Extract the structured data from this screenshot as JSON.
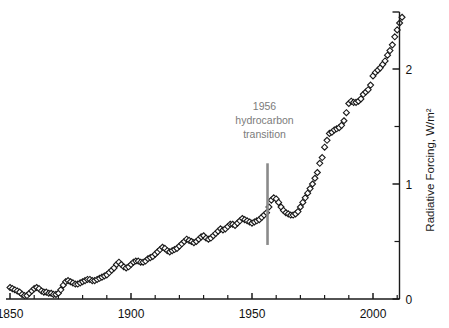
{
  "chart_data": {
    "type": "scatter",
    "title": "",
    "subtitle": "",
    "xlabel": "",
    "ylabel": "Radiative Forcing, W/m²",
    "xlim": [
      1848,
      2014
    ],
    "ylim": [
      0,
      2.6
    ],
    "x_ticks_major": [
      1850,
      1900,
      1950,
      2000
    ],
    "x_tick_labels": [
      "1850",
      "1900",
      "1950",
      "2000"
    ],
    "x_tick_interval_minor": 10,
    "y_ticks_major": [
      0,
      1,
      2
    ],
    "y_tick_labels": [
      "0",
      "1",
      "2"
    ],
    "y_ticks_minor": [
      0.5,
      1.5,
      2.5
    ],
    "grid": false,
    "legend": null,
    "axis_position": {
      "y_axis": "right",
      "x_axis": "bottom"
    },
    "marker": {
      "shape": "diamond-open",
      "size": 4,
      "edge_color": "#1a1a1a",
      "face_color": "#ffffff"
    },
    "annotations": [
      {
        "name": "hydrocarbon-transition",
        "lines": [
          "1956",
          "hydrocarbon",
          "transition"
        ],
        "x": 1956,
        "text_color": "#8a8a8a",
        "line_color": "#8a8a8a",
        "line_y_top": 1.18,
        "line_y_bottom": 0.47
      }
    ],
    "series": [
      {
        "name": "Radiative forcing",
        "x": [
          1850,
          1851,
          1852,
          1853,
          1854,
          1855,
          1856,
          1857,
          1858,
          1859,
          1860,
          1861,
          1862,
          1863,
          1864,
          1865,
          1866,
          1867,
          1868,
          1869,
          1870,
          1871,
          1872,
          1873,
          1874,
          1875,
          1876,
          1877,
          1878,
          1879,
          1880,
          1881,
          1882,
          1883,
          1884,
          1885,
          1886,
          1887,
          1888,
          1889,
          1890,
          1891,
          1892,
          1893,
          1894,
          1895,
          1896,
          1897,
          1898,
          1899,
          1900,
          1901,
          1902,
          1903,
          1904,
          1905,
          1906,
          1907,
          1908,
          1909,
          1910,
          1911,
          1912,
          1913,
          1914,
          1915,
          1916,
          1917,
          1918,
          1919,
          1920,
          1921,
          1922,
          1923,
          1924,
          1925,
          1926,
          1927,
          1928,
          1929,
          1930,
          1931,
          1932,
          1933,
          1934,
          1935,
          1936,
          1937,
          1938,
          1939,
          1940,
          1941,
          1942,
          1943,
          1944,
          1945,
          1946,
          1947,
          1948,
          1949,
          1950,
          1951,
          1952,
          1953,
          1954,
          1955,
          1956,
          1957,
          1958,
          1959,
          1960,
          1961,
          1962,
          1963,
          1964,
          1965,
          1966,
          1967,
          1968,
          1969,
          1970,
          1971,
          1972,
          1973,
          1974,
          1975,
          1976,
          1977,
          1978,
          1979,
          1980,
          1981,
          1982,
          1983,
          1984,
          1985,
          1986,
          1987,
          1988,
          1989,
          1990,
          1991,
          1992,
          1993,
          1994,
          1995,
          1996,
          1997,
          1998,
          1999,
          2000,
          2001,
          2002,
          2003,
          2004,
          2005,
          2006,
          2007,
          2008,
          2009,
          2010,
          2011,
          2012
        ],
        "y": [
          0.1,
          0.09,
          0.08,
          0.07,
          0.06,
          0.04,
          0.03,
          0.03,
          0.05,
          0.07,
          0.09,
          0.1,
          0.09,
          0.07,
          0.06,
          0.06,
          0.05,
          0.05,
          0.04,
          0.04,
          0.05,
          0.08,
          0.12,
          0.15,
          0.16,
          0.15,
          0.14,
          0.13,
          0.13,
          0.14,
          0.15,
          0.16,
          0.17,
          0.17,
          0.16,
          0.16,
          0.17,
          0.18,
          0.19,
          0.2,
          0.21,
          0.23,
          0.25,
          0.27,
          0.3,
          0.32,
          0.3,
          0.28,
          0.27,
          0.28,
          0.3,
          0.32,
          0.33,
          0.33,
          0.32,
          0.32,
          0.33,
          0.35,
          0.36,
          0.37,
          0.39,
          0.41,
          0.43,
          0.45,
          0.44,
          0.42,
          0.41,
          0.42,
          0.43,
          0.44,
          0.46,
          0.48,
          0.5,
          0.52,
          0.51,
          0.5,
          0.49,
          0.5,
          0.52,
          0.54,
          0.55,
          0.53,
          0.52,
          0.53,
          0.55,
          0.57,
          0.59,
          0.61,
          0.6,
          0.61,
          0.63,
          0.65,
          0.65,
          0.64,
          0.66,
          0.68,
          0.7,
          0.69,
          0.68,
          0.67,
          0.66,
          0.67,
          0.68,
          0.69,
          0.71,
          0.73,
          0.75,
          0.8,
          0.86,
          0.88,
          0.87,
          0.84,
          0.8,
          0.77,
          0.75,
          0.74,
          0.73,
          0.73,
          0.74,
          0.76,
          0.8,
          0.84,
          0.88,
          0.92,
          0.96,
          1.0,
          1.05,
          1.1,
          1.18,
          1.23,
          1.32,
          1.38,
          1.44,
          1.45,
          1.47,
          1.48,
          1.49,
          1.51,
          1.55,
          1.62,
          1.7,
          1.72,
          1.71,
          1.71,
          1.72,
          1.74,
          1.78,
          1.8,
          1.82,
          1.86,
          1.94,
          1.97,
          1.99,
          2.01,
          2.04,
          2.07,
          2.12,
          2.16,
          2.21,
          2.28,
          2.34,
          2.4,
          2.45
        ]
      }
    ]
  },
  "axis": {
    "y_title": "Radiative Forcing, W/m²",
    "x_labels": [
      "1850",
      "1900",
      "1950",
      "2000"
    ],
    "y_labels": [
      "0",
      "1",
      "2"
    ]
  },
  "annotation": {
    "line1": "1956",
    "line2": "hydrocarbon",
    "line3": "transition"
  },
  "colors": {
    "axis": "#1a1a1a",
    "marker_edge": "#1a1a1a",
    "annotation": "#8a8a8a",
    "background": "#ffffff"
  }
}
